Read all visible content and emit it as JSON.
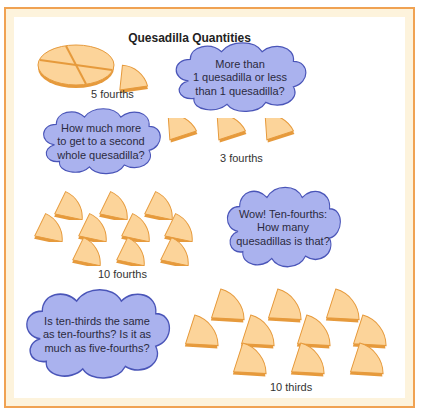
{
  "title": "Quesadilla Quantities",
  "colors": {
    "frame_border": "#f0a252",
    "frame_fill": "#fdf3dc",
    "piece_fill": "#fcd49a",
    "piece_edge": "#e69a3c",
    "cloud_fill": "#aab2ee",
    "cloud_edge": "#4a55b8"
  },
  "groups": [
    {
      "label": "5 fourths",
      "pieces": 5,
      "unit": "fourths"
    },
    {
      "label": "3 fourths",
      "pieces": 3,
      "unit": "fourths"
    },
    {
      "label": "10 fourths",
      "pieces": 10,
      "unit": "fourths"
    },
    {
      "label": "10 thirds",
      "pieces": 10,
      "unit": "thirds"
    }
  ],
  "clouds": [
    {
      "text": "More than\n1 quesadilla or less\nthan 1 quesadilla?"
    },
    {
      "text": "How much more\nto get to a second\nwhole quesadilla?"
    },
    {
      "text": "Wow! Ten-fourths:\nHow many\nquesadillas is that?"
    },
    {
      "text": "Is ten-thirds the same\nas ten-fourths? Is it as\nmuch as five-fourths?"
    }
  ]
}
